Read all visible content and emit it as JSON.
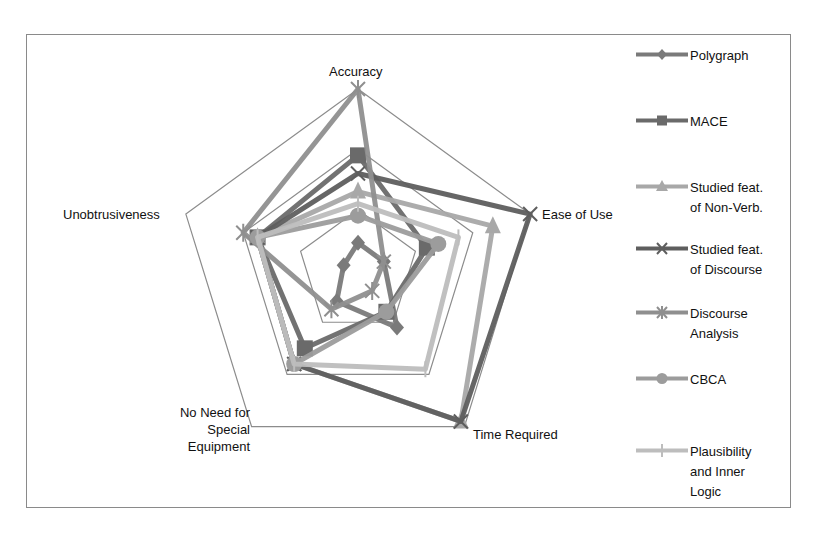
{
  "chart_data": {
    "type": "radar",
    "title": "",
    "axes": [
      "Accuracy",
      "Ease of Use",
      "Time Required",
      "No Need for Special Equipment",
      "Unobtrusiveness"
    ],
    "range": [
      0,
      3
    ],
    "grid_rings": [
      1,
      2,
      3
    ],
    "legend_position": "right",
    "series": [
      {
        "name": "Polygraph",
        "marker": "diamond",
        "color": "#7a7a7a",
        "values": [
          0.45,
          0.45,
          1.1,
          0.6,
          0.25
        ]
      },
      {
        "name": "MACE",
        "marker": "square",
        "color": "#6a6a6a",
        "values": [
          1.9,
          1.2,
          0.8,
          1.5,
          1.75
        ]
      },
      {
        "name": "Studied feat. of Non-Verb.",
        "marker": "triangle",
        "color": "#a8a8a8",
        "values": [
          1.3,
          2.35,
          2.9,
          1.8,
          1.75
        ]
      },
      {
        "name": "Studied feat. of Discourse",
        "marker": "x",
        "color": "#5e5e5e",
        "values": [
          1.6,
          3.0,
          2.9,
          1.8,
          1.75
        ]
      },
      {
        "name": "Discourse Analysis",
        "marker": "star",
        "color": "#8f8f8f",
        "values": [
          3.0,
          0.45,
          0.4,
          0.75,
          2.0
        ]
      },
      {
        "name": "CBCA",
        "marker": "circle",
        "color": "#9c9c9c",
        "values": [
          0.9,
          1.4,
          0.8,
          1.8,
          1.75
        ]
      },
      {
        "name": "Plausibility and Inner Logic",
        "marker": "plus",
        "color": "#bdbdbd",
        "values": [
          1.1,
          1.75,
          1.9,
          1.8,
          1.75
        ]
      }
    ]
  },
  "axis_labels": {
    "accuracy": "Accuracy",
    "ease": "Ease of Use",
    "time": "Time Required",
    "equip_1": "No Need for",
    "equip_2": "Special",
    "equip_3": "Equipment",
    "unob": "Unobtrusiveness"
  },
  "legend": [
    {
      "line1": "Polygraph",
      "line2": "",
      "line3": ""
    },
    {
      "line1": "MACE",
      "line2": "",
      "line3": ""
    },
    {
      "line1": "Studied feat.",
      "line2": "of Non-Verb.",
      "line3": ""
    },
    {
      "line1": "Studied feat.",
      "line2": "of Discourse",
      "line3": ""
    },
    {
      "line1": "Discourse",
      "line2": "Analysis",
      "line3": ""
    },
    {
      "line1": "CBCA",
      "line2": "",
      "line3": ""
    },
    {
      "line1": "Plausibility",
      "line2": "and Inner",
      "line3": "Logic"
    }
  ]
}
